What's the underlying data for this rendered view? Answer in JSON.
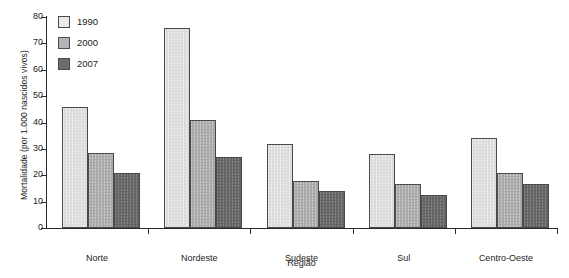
{
  "chart_data": {
    "type": "bar",
    "title": "",
    "subtitle": "",
    "xlabel": "Região",
    "ylabel": "Mortalidade (por 1.000 nascidos vivos)",
    "categories": [
      "Norte",
      "Nordeste",
      "Sudeste",
      "Sul",
      "Centro-Oeste"
    ],
    "series": [
      {
        "name": "1990",
        "color": "#e9e9e9",
        "values": [
          46,
          76,
          32,
          28,
          34
        ]
      },
      {
        "name": "2000",
        "color": "#b3b3b3",
        "values": [
          28.5,
          41,
          18,
          16.5,
          21
        ]
      },
      {
        "name": "2007",
        "color": "#6e6e6e",
        "values": [
          21,
          27,
          14,
          12.5,
          16.5
        ]
      }
    ],
    "ylim": [
      0,
      80
    ],
    "yticks": [
      0,
      10,
      20,
      30,
      40,
      50,
      60,
      70,
      80
    ],
    "ytick_labels": [
      "0",
      "10",
      "20",
      "30",
      "40",
      "50",
      "60",
      "70",
      "80"
    ],
    "grid": false,
    "legend_position": "top-left",
    "bar_outline_color": "#4a4a4a",
    "axis_color": "#2a2a2a",
    "background_color": "#ffffff"
  },
  "legend": {
    "entries": [
      {
        "label": "1990"
      },
      {
        "label": "2000"
      },
      {
        "label": "2007"
      }
    ]
  }
}
